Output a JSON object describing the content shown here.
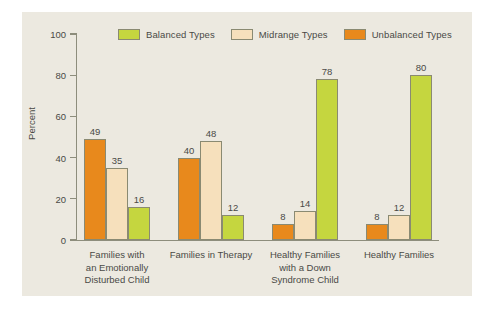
{
  "chart_data": {
    "type": "bar",
    "title": "",
    "xlabel": "",
    "ylabel": "Percent",
    "ylim": [
      0,
      100
    ],
    "yticks": [
      0,
      20,
      40,
      60,
      80,
      100
    ],
    "grid": false,
    "legend_position": "top",
    "categories": [
      "Families with\nan Emotionally\nDisturbed Child",
      "Families in Therapy",
      "Healthy Families\nwith a Down\nSyndrome Child",
      "Healthy Families"
    ],
    "series": [
      {
        "name": "Balanced Types",
        "color": "#c4d councilor",
        "values": [
          16,
          12,
          78,
          80
        ]
      },
      {
        "name": "Midrange Types",
        "values": [
          35,
          48,
          14,
          12
        ]
      },
      {
        "name": "Unbalanced Types",
        "values": [
          49,
          40,
          8,
          8
        ]
      }
    ],
    "series_draw_order": [
      "Unbalanced Types",
      "Midrange Types",
      "Balanced Types"
    ]
  },
  "legend": {
    "items": [
      {
        "label": "Balanced Types",
        "color": "#c5d63f"
      },
      {
        "label": "Midrange Types",
        "color": "#f6e0bc"
      },
      {
        "label": "Unbalanced Types",
        "color": "#e8891c"
      }
    ]
  },
  "axis": {
    "y_title": "Percent",
    "y_tick_labels": [
      "100",
      "80",
      "60",
      "40",
      "20",
      "0"
    ]
  },
  "colors": {
    "balanced": "#c5d63f",
    "midrange": "#f6e0bc",
    "unbalanced": "#e8891c",
    "panel_background": "#ece9e0",
    "page_background": "#ffffff",
    "axis": "#8d8d7c",
    "text": "#4a4a46",
    "bar_outline": "#8a8a72"
  },
  "groups": [
    {
      "label": "Families with\nan Emotionally\nDisturbed Child",
      "bars": [
        {
          "series": "Unbalanced Types",
          "value": 49,
          "label": "49"
        },
        {
          "series": "Midrange Types",
          "value": 35,
          "label": "35"
        },
        {
          "series": "Balanced Types",
          "value": 16,
          "label": "16"
        }
      ]
    },
    {
      "label": "Families in Therapy",
      "bars": [
        {
          "series": "Unbalanced Types",
          "value": 40,
          "label": "40"
        },
        {
          "series": "Midrange Types",
          "value": 48,
          "label": "48"
        },
        {
          "series": "Balanced Types",
          "value": 12,
          "label": "12"
        }
      ]
    },
    {
      "label": "Healthy Families\nwith a Down\nSyndrome Child",
      "bars": [
        {
          "series": "Unbalanced Types",
          "value": 8,
          "label": "8"
        },
        {
          "series": "Midrange Types",
          "value": 14,
          "label": "14"
        },
        {
          "series": "Balanced Types",
          "value": 78,
          "label": "78"
        }
      ]
    },
    {
      "label": "Healthy Families",
      "bars": [
        {
          "series": "Unbalanced Types",
          "value": 8,
          "label": "8"
        },
        {
          "series": "Midrange Types",
          "value": 12,
          "label": "12"
        },
        {
          "series": "Balanced Types",
          "value": 80,
          "label": "80"
        }
      ]
    }
  ]
}
